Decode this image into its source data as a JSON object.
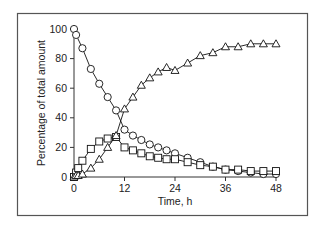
{
  "chart_data": {
    "type": "line",
    "title": "",
    "xlabel": "Time, h",
    "ylabel": "Percentage of total amount",
    "xlim": [
      0,
      48
    ],
    "ylim": [
      0,
      100
    ],
    "x_ticks": [
      0,
      12,
      24,
      36,
      48
    ],
    "y_ticks": [
      0,
      20,
      40,
      60,
      80,
      100
    ],
    "grid": false,
    "legend": null,
    "series": [
      {
        "name": "circles",
        "marker": "circle",
        "x": [
          0,
          0.5,
          2,
          4,
          6,
          8,
          10,
          12,
          14,
          16,
          18,
          20,
          22,
          24,
          27,
          30,
          33,
          36,
          39,
          42,
          45,
          48
        ],
        "values": [
          100,
          96,
          87,
          73,
          63,
          54,
          45,
          32,
          28,
          25,
          22,
          20,
          18,
          16,
          13,
          10,
          7,
          5,
          4,
          3,
          2,
          2
        ]
      },
      {
        "name": "squares",
        "marker": "square",
        "x": [
          0,
          0.5,
          1,
          2,
          4,
          6,
          8,
          10,
          12,
          14,
          16,
          18,
          20,
          22,
          24,
          27,
          30,
          33,
          36,
          39,
          42,
          45,
          48
        ],
        "values": [
          0,
          3,
          6,
          11,
          19,
          24,
          26,
          27,
          20,
          18,
          16,
          14,
          13,
          12,
          12,
          10,
          8,
          7,
          5,
          5,
          4,
          4,
          4
        ]
      },
      {
        "name": "triangles",
        "marker": "triangle",
        "x": [
          0,
          0.5,
          1,
          2,
          4,
          6,
          8,
          10,
          12,
          14,
          16,
          18,
          20,
          22,
          24,
          27,
          30,
          33,
          36,
          39,
          42,
          45,
          48
        ],
        "values": [
          0,
          1,
          1,
          2,
          6,
          12,
          20,
          28,
          46,
          54,
          62,
          67,
          71,
          74,
          72,
          77,
          82,
          84,
          88,
          88,
          90,
          90,
          90
        ]
      }
    ]
  }
}
